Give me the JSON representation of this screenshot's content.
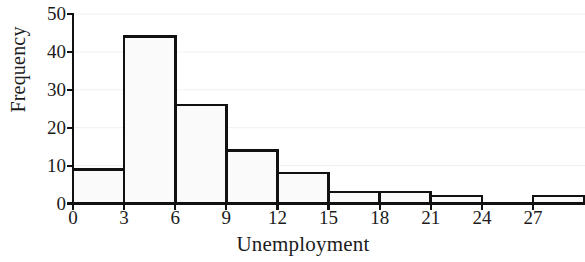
{
  "chart_data": {
    "type": "bar",
    "title": "",
    "xlabel": "Unemployment",
    "ylabel": "Frequency",
    "bin_edges": [
      0,
      3,
      6,
      9,
      12,
      15,
      18,
      21,
      24,
      27,
      30
    ],
    "categories": [
      "0-3",
      "3-6",
      "6-9",
      "9-12",
      "12-15",
      "15-18",
      "18-21",
      "21-24",
      "24-27",
      "27-30"
    ],
    "values": [
      9,
      44,
      26,
      14,
      8,
      3,
      3,
      2,
      0,
      2
    ],
    "xlim": [
      0,
      30
    ],
    "ylim": [
      0,
      50
    ],
    "xticks": [
      0,
      3,
      6,
      9,
      12,
      15,
      18,
      21,
      24,
      27
    ],
    "yticks": [
      0,
      10,
      20,
      30,
      40,
      50
    ],
    "xtick_labels": [
      "0",
      "3",
      "6",
      "9",
      "12",
      "15",
      "18",
      "21",
      "24",
      "27"
    ],
    "ytick_labels": [
      "0",
      "10",
      "20",
      "30",
      "40",
      "50"
    ],
    "grid": true,
    "grid_axis": "y",
    "legend": false,
    "bar_fill_color": "#fafafa",
    "bar_edge_color": "#111111",
    "grid_color": "#f0f0f0",
    "axis_color": "#111111"
  }
}
